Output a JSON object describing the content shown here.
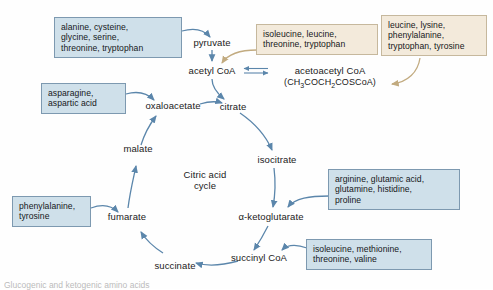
{
  "diagram": {
    "center_label": "Citric acid\ncycle",
    "center_line1": "Citric acid",
    "center_line2": "cycle",
    "colors": {
      "box_blue_fill": "#cfe0ea",
      "box_blue_border": "#7d99b0",
      "box_cream_fill": "#f3eadb",
      "box_cream_border": "#c6b89d",
      "arrow_blue": "#5b86ab",
      "arrow_tan": "#c2ab80",
      "text": "#1a1a1a",
      "background": "#fefefe"
    },
    "metabolites": [
      {
        "id": "pyruvate",
        "label": "pyruvate"
      },
      {
        "id": "acetyl-coa",
        "label": "acetyl CoA"
      },
      {
        "id": "acetoacetyl-coa",
        "label": "acetoacetyl CoA"
      },
      {
        "id": "acetoacetyl-coa-formula",
        "label": "(CH3COCH2COSCoA)"
      },
      {
        "id": "oxaloacetate",
        "label": "oxaloacetate"
      },
      {
        "id": "citrate",
        "label": "citrate"
      },
      {
        "id": "isocitrate",
        "label": "isocitrate"
      },
      {
        "id": "alpha-ketoglutarate",
        "label": "α-ketoglutarate"
      },
      {
        "id": "succinyl-coa",
        "label": "succinyl CoA"
      },
      {
        "id": "succinate",
        "label": "succinate"
      },
      {
        "id": "fumarate",
        "label": "fumarate"
      },
      {
        "id": "malate",
        "label": "malate"
      }
    ],
    "amino_acid_boxes": [
      {
        "id": "pyruvate-precursors",
        "style": "blue",
        "lines": [
          "alanine, cysteine,",
          "glycine, serine,",
          "threonine, tryptophan"
        ]
      },
      {
        "id": "acetyl-coa-precursors",
        "style": "cream",
        "lines": [
          "isoleucine, leucine,",
          "threonine, tryptophan"
        ]
      },
      {
        "id": "acetoacetyl-coa-precursors",
        "style": "cream",
        "lines": [
          "leucine, lysine,",
          "phenylalanine,",
          "tryptophan, tyrosine"
        ]
      },
      {
        "id": "oxaloacetate-precursors",
        "style": "blue",
        "lines": [
          "asparagine,",
          "aspartic acid"
        ]
      },
      {
        "id": "alpha-ketoglutarate-precursors",
        "style": "blue",
        "lines": [
          "arginine, glutamic acid,",
          "glutamine, histidine,",
          "proline"
        ]
      },
      {
        "id": "succinyl-coa-precursors",
        "style": "blue",
        "lines": [
          "isoleucine, methionine,",
          "threonine, valine"
        ]
      },
      {
        "id": "fumarate-precursors",
        "style": "blue",
        "lines": [
          "phenylalanine,",
          "tyrosine"
        ]
      }
    ],
    "caption": "Glucogenic and ketogenic amino acids"
  }
}
